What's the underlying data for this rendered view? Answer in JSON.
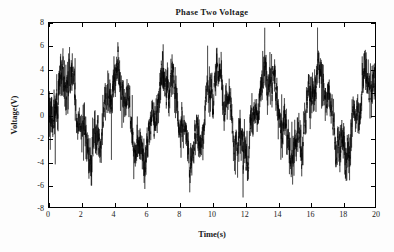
{
  "chart_data": {
    "type": "line",
    "title": "Phase Two Voltage",
    "xlabel": "Time(s)",
    "ylabel": "Voltage(V)",
    "xlim": [
      0,
      20
    ],
    "ylim": [
      -8,
      8
    ],
    "xticks": [
      0,
      2,
      4,
      6,
      8,
      10,
      12,
      14,
      16,
      18,
      20
    ],
    "yticks": [
      8,
      6,
      4,
      2,
      0,
      -2,
      -4,
      -6,
      -8
    ],
    "xticklabels": [
      "0",
      "2",
      "4",
      "6",
      "8",
      "10",
      "12",
      "14",
      "16",
      "18",
      "20"
    ],
    "yticklabels": [
      "8",
      "6",
      "4",
      "2",
      "0",
      "-2",
      "-4",
      "-6",
      "-8"
    ],
    "grid": false,
    "legend": null,
    "line_color": "#000000",
    "background_color": "#ffffff",
    "axis_color": "#000000",
    "series": [
      {
        "name": "Phase Two Voltage",
        "description": "Noisy amplitude-modulated voltage waveform sampled densely over 20 seconds",
        "envelope_frequency_hz": 0.323,
        "envelope_amplitude_v": 3.2,
        "envelope_offset_v": 0.0,
        "carrier_frequency_hz": 1.45,
        "carrier_amplitude_v": 1.1,
        "noise_amplitude_v": 1.5,
        "sample_count": 4000,
        "observed_max_v": 6.4,
        "observed_min_v": -7.1,
        "envelope_peak_times_s": [
          0.5,
          2.4,
          5.5,
          8.7,
          11.8,
          14.9,
          18.1
        ],
        "envelope_peak_values_v": [
          4.2,
          6.0,
          6.4,
          5.8,
          6.4,
          6.4,
          5.3
        ],
        "envelope_trough_times_s": [
          1.5,
          3.9,
          7.0,
          10.2,
          13.4,
          16.4,
          19.5
        ],
        "envelope_trough_values_v": [
          -4.1,
          -5.3,
          -7.1,
          -5.6,
          -7.1,
          -4.8,
          -5.5
        ]
      }
    ]
  }
}
